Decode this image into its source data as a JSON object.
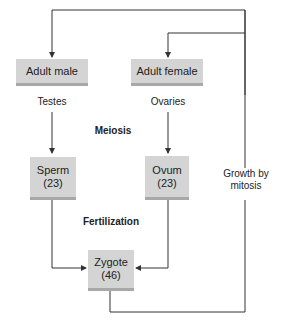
{
  "diagram": {
    "nodes": {
      "adult_male": {
        "label": "Adult male"
      },
      "adult_female": {
        "label": "Adult female"
      },
      "sperm": {
        "label": "Sperm",
        "count": "(23)"
      },
      "ovum": {
        "label": "Ovum",
        "count": "(23)"
      },
      "zygote": {
        "label": "Zygote",
        "count": "(46)"
      }
    },
    "labels": {
      "testes": "Testes",
      "ovaries": "Ovaries",
      "meiosis": "Meiosis",
      "fertilization": "Fertilization",
      "growth_line1": "Growth by",
      "growth_line2": "mitosis"
    },
    "colors": {
      "box_fill": "#d4d4d4",
      "box_shadow": "#a8a8a8",
      "line": "#333333"
    }
  }
}
